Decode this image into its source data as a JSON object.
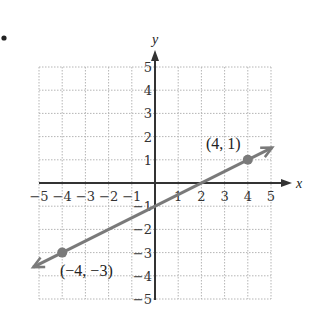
{
  "chart_data": {
    "type": "line",
    "title": "",
    "xlabel": "x",
    "ylabel": "y",
    "xlim": [
      -5,
      5
    ],
    "ylim": [
      -5,
      5
    ],
    "grid": true,
    "x_ticks": [
      "-5",
      "-4",
      "-3",
      "-2",
      "-1",
      "1",
      "2",
      "3",
      "4",
      "5"
    ],
    "y_ticks": [
      "5",
      "4",
      "3",
      "2",
      "1",
      "-1",
      "-2",
      "-3",
      "-4",
      "-5"
    ],
    "series": [
      {
        "name": "line",
        "equation": "y = 0.5x - 1",
        "slope": 0.5,
        "intercept": -1,
        "color": "#7a7a7a",
        "extends_both_directions": true,
        "points": [
          {
            "x": 4,
            "y": 1,
            "label": "(4, 1)"
          },
          {
            "x": -4,
            "y": -3,
            "label": "(-4, -3)"
          }
        ]
      }
    ]
  },
  "labels": {
    "x_axis": "x",
    "y_axis": "y",
    "point_a": "(4, 1)",
    "point_b": "(−4, −3)",
    "bullet": "•"
  },
  "colors": {
    "axis": "#333333",
    "grid": "#b5b5b5",
    "line": "#7a7a7a",
    "point": "#7a7a7a"
  }
}
